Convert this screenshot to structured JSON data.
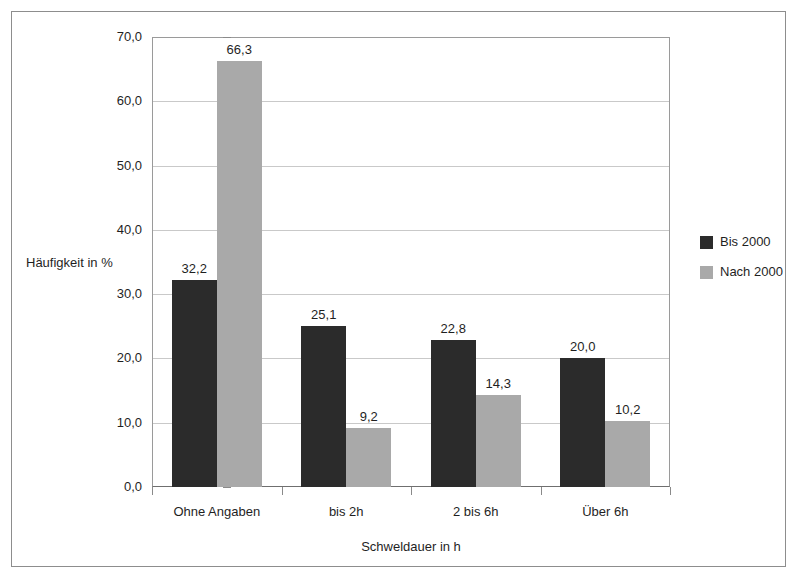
{
  "chart_data": {
    "type": "bar",
    "title": "",
    "categories": [
      "Ohne Angaben",
      "bis 2h",
      "2 bis 6h",
      "Über 6h"
    ],
    "series": [
      {
        "name": "Bis 2000",
        "color": "#2b2b2b",
        "values": [
          32.2,
          25.1,
          22.8,
          20.0
        ],
        "labels": [
          "32,2",
          "25,1",
          "22,8",
          "20,0"
        ]
      },
      {
        "name": "Nach 2000",
        "color": "#a9a9a9",
        "values": [
          66.3,
          9.2,
          14.3,
          10.2
        ],
        "labels": [
          "66,3",
          "9,2",
          "14,3",
          "10,2"
        ]
      }
    ],
    "xlabel": "Schweldauer in h",
    "ylabel": "Häufigkeit in %",
    "ylim": [
      0,
      70
    ],
    "ytick_values": [
      0,
      10,
      20,
      30,
      40,
      50,
      60,
      70
    ],
    "ytick_labels": [
      "0,0",
      "10,0",
      "20,0",
      "30,0",
      "40,0",
      "50,0",
      "60,0",
      "70,0"
    ],
    "grid": true,
    "legend_position": "right"
  },
  "axes": {
    "y_title": "Häufigkeit in %",
    "x_title": "Schweldauer in h",
    "y_ticks": [
      {
        "label": "70,0",
        "value": 70
      },
      {
        "label": "60,0",
        "value": 60
      },
      {
        "label": "50,0",
        "value": 50
      },
      {
        "label": "40,0",
        "value": 40
      },
      {
        "label": "30,0",
        "value": 30
      },
      {
        "label": "20,0",
        "value": 20
      },
      {
        "label": "10,0",
        "value": 10
      },
      {
        "label": "0,0",
        "value": 0
      }
    ],
    "x_categories": [
      "Ohne Angaben",
      "bis 2h",
      "2 bis 6h",
      "Über 6h"
    ]
  },
  "legend": {
    "entries": [
      {
        "label": "Bis 2000",
        "color": "#2b2b2b"
      },
      {
        "label": "Nach 2000",
        "color": "#a9a9a9"
      }
    ]
  },
  "colors": {
    "series_bis_2000": "#2b2b2b",
    "series_nach_2000": "#a9a9a9",
    "gridline": "#c9c9c9",
    "axis": "#8a8a8a",
    "frame": "#8d8d8d",
    "text": "#1f1f1f",
    "background": "#ffffff"
  }
}
